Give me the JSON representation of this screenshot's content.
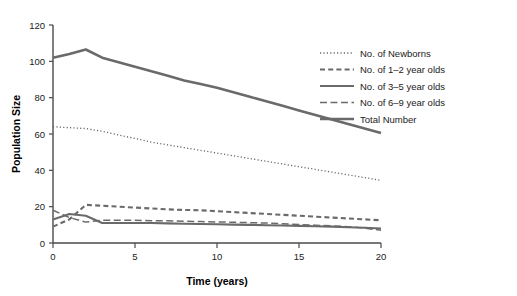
{
  "chart_data": {
    "type": "line",
    "title": "",
    "xlabel": "Time (years)",
    "ylabel": "Population Size",
    "xlim": [
      0,
      20
    ],
    "ylim": [
      0,
      120
    ],
    "xticks": [
      0,
      5,
      10,
      15,
      20
    ],
    "yticks": [
      0,
      20,
      40,
      60,
      80,
      100,
      120
    ],
    "grid": false,
    "legend_position": "top-right",
    "line_color": "#6a6a6a",
    "x": [
      0,
      1,
      2,
      3,
      4,
      5,
      6,
      7,
      8,
      9,
      10,
      11,
      12,
      13,
      14,
      15,
      16,
      17,
      18,
      19,
      20
    ],
    "series": [
      {
        "name": "No. of Newborns",
        "style": "dotted",
        "values": [
          64,
          63.5,
          63,
          61.5,
          59.5,
          57.5,
          55.5,
          54,
          52.5,
          51,
          49.5,
          48,
          46.5,
          45,
          43.5,
          42,
          40.5,
          39,
          37.5,
          36,
          34.5
        ]
      },
      {
        "name": "No. of 1–2 year olds",
        "style": "dashed-short",
        "values": [
          9,
          13,
          21,
          20.5,
          20,
          19.5,
          19,
          18.5,
          18.2,
          18,
          17.5,
          17,
          16.5,
          16,
          15.5,
          15,
          14.5,
          14,
          13.5,
          13,
          12.5
        ]
      },
      {
        "name": "No. of 3–5 year olds",
        "style": "solid-thin",
        "values": [
          13,
          16,
          15,
          11,
          11,
          11,
          11,
          10.8,
          10.6,
          10.5,
          10.3,
          10.1,
          10,
          9.8,
          9.6,
          9.4,
          9.2,
          9,
          8.7,
          8.4,
          8
        ]
      },
      {
        "name": "No. of 6–9 year olds",
        "style": "dashed-long",
        "values": [
          18,
          14,
          11.5,
          12.5,
          12.5,
          12.5,
          12.3,
          12.2,
          12,
          11.8,
          11.6,
          11.4,
          11.2,
          11,
          10.6,
          10.2,
          9.8,
          9.4,
          9,
          8.2,
          7
        ]
      },
      {
        "name": "Total Number",
        "style": "solid-thick",
        "values": [
          102,
          104,
          106.5,
          102,
          99.5,
          97,
          94.5,
          92,
          89.5,
          87.5,
          85.5,
          83,
          80.5,
          78,
          75.5,
          73,
          70.5,
          68,
          65.5,
          63,
          60.5
        ]
      }
    ]
  },
  "legend": {
    "items": [
      {
        "label": "No. of Newborns",
        "style": "dotted"
      },
      {
        "label": "No. of 1–2 year olds",
        "style": "dashed-short"
      },
      {
        "label": "No. of 3–5 year olds",
        "style": "solid-thin"
      },
      {
        "label": "No. of 6–9 year olds",
        "style": "dashed-long"
      },
      {
        "label": "Total Number",
        "style": "solid-thick"
      }
    ]
  },
  "axes": {
    "x_title": "Time (years)",
    "y_title": "Population Size",
    "x_tick_labels": [
      "0",
      "5",
      "10",
      "15",
      "20"
    ],
    "y_tick_labels": [
      "0",
      "20",
      "40",
      "60",
      "80",
      "100",
      "120"
    ]
  }
}
